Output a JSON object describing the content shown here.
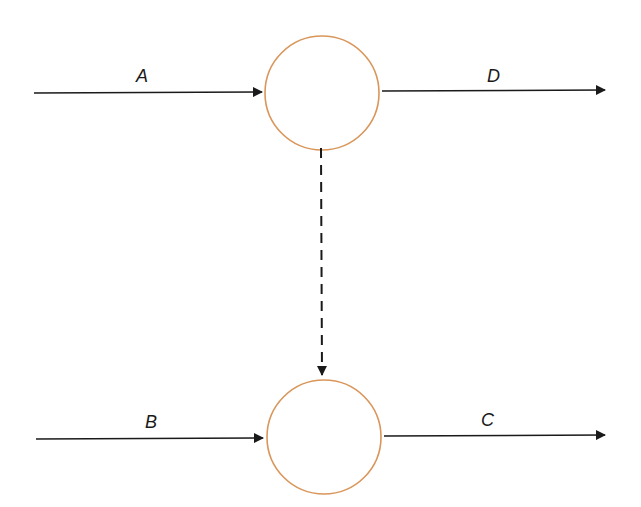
{
  "diagram": {
    "type": "flow-diagram",
    "colors": {
      "node_stroke": "#d9965b",
      "arrow": "#1a1a1a",
      "background": "#ffffff"
    },
    "nodes": [
      {
        "id": "top-node",
        "shape": "circle",
        "cx": 322,
        "cy": 93,
        "r": 57
      },
      {
        "id": "bottom-node",
        "shape": "circle",
        "cx": 324,
        "cy": 437,
        "r": 57
      }
    ],
    "edges": [
      {
        "id": "A",
        "label": "A",
        "from": "external",
        "to": "top-node",
        "style": "solid"
      },
      {
        "id": "D",
        "label": "D",
        "from": "top-node",
        "to": "external",
        "style": "solid"
      },
      {
        "id": "B",
        "label": "B",
        "from": "external",
        "to": "bottom-node",
        "style": "solid"
      },
      {
        "id": "C",
        "label": "C",
        "from": "bottom-node",
        "to": "external",
        "style": "solid"
      },
      {
        "id": "link",
        "label": "",
        "from": "top-node",
        "to": "bottom-node",
        "style": "dashed"
      }
    ]
  },
  "labels": {
    "a": "A",
    "b": "B",
    "c": "C",
    "d": "D"
  }
}
